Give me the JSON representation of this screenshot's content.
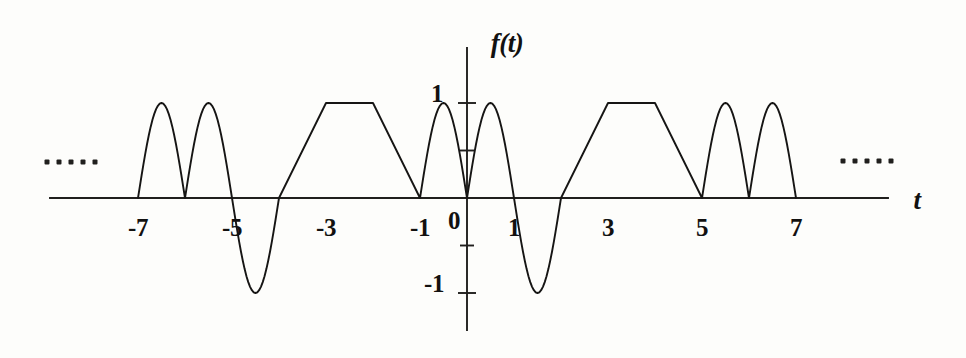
{
  "figure": {
    "background_color": "#fdfdfb",
    "curve_color": "#161514",
    "axis_color": "#201f1d"
  },
  "axes": {
    "y_axis_label": "f(t)",
    "x_axis_label": "t",
    "origin_label": "0",
    "x_tick_labels": [
      "-7",
      "-5",
      "-3",
      "-1",
      "1",
      "3",
      "5",
      "7"
    ],
    "x_tick_values": [
      -7,
      -5,
      -3,
      -1,
      1,
      3,
      5,
      7
    ],
    "y_tick_labels": [
      "1",
      "-1"
    ],
    "y_tick_values": [
      1,
      -1
    ],
    "y_minor_tick_values": [
      0.5,
      -0.5
    ],
    "left_continuation": "…",
    "right_continuation": "…"
  },
  "chart_data": {
    "type": "line",
    "title": "",
    "xlabel": "t",
    "ylabel": "f(t)",
    "xlim": [
      -8.85,
      8.95
    ],
    "ylim": [
      -1.35,
      1.45
    ],
    "grid": false,
    "legend": null,
    "periodic": true,
    "period": 8,
    "segments": [
      {
        "kind": "half-sine-positive",
        "t_start": -7,
        "t_end": -6,
        "amplitude": 1
      },
      {
        "kind": "half-sine-positive",
        "t_start": -6,
        "t_end": -5,
        "amplitude": 1
      },
      {
        "kind": "half-sine-negative",
        "t_start": -5,
        "t_end": -4,
        "amplitude": -1
      },
      {
        "kind": "zero",
        "t_start": -4,
        "t_end": -4,
        "amplitude": 0
      },
      {
        "kind": "ramp-up",
        "t_start": -4,
        "t_end": -3,
        "amplitude": 1
      },
      {
        "kind": "flat-top",
        "t_start": -3,
        "t_end": -2,
        "amplitude": 1
      },
      {
        "kind": "ramp-down",
        "t_start": -2,
        "t_end": -1,
        "amplitude": 0
      },
      {
        "kind": "half-sine-positive",
        "t_start": -1,
        "t_end": 0,
        "amplitude": 1
      },
      {
        "kind": "half-sine-positive",
        "t_start": 0,
        "t_end": 1,
        "amplitude": 1
      },
      {
        "kind": "half-sine-negative",
        "t_start": 1,
        "t_end": 2,
        "amplitude": -1
      },
      {
        "kind": "ramp-up",
        "t_start": 2,
        "t_end": 3,
        "amplitude": 1
      },
      {
        "kind": "flat-top",
        "t_start": 3,
        "t_end": 4,
        "amplitude": 1
      },
      {
        "kind": "ramp-down",
        "t_start": 4,
        "t_end": 5,
        "amplitude": 0
      },
      {
        "kind": "half-sine-positive",
        "t_start": 5,
        "t_end": 6,
        "amplitude": 1
      },
      {
        "kind": "half-sine-positive",
        "t_start": 6,
        "t_end": 7,
        "amplitude": 1
      }
    ],
    "x": [
      -7.0,
      -6.9,
      -6.8,
      -6.7,
      -6.6,
      -6.5,
      -6.4,
      -6.3,
      -6.2,
      -6.1,
      -6.0,
      -5.9,
      -5.8,
      -5.7,
      -5.6,
      -5.5,
      -5.4,
      -5.3,
      -5.2,
      -5.1,
      -5.0,
      -4.9,
      -4.8,
      -4.7,
      -4.6,
      -4.5,
      -4.4,
      -4.3,
      -4.2,
      -4.1,
      -4.0,
      -3.0,
      -2.0,
      -1.0,
      -0.9,
      -0.8,
      -0.7,
      -0.6,
      -0.5,
      -0.4,
      -0.3,
      -0.2,
      -0.1,
      0.0,
      0.1,
      0.2,
      0.3,
      0.4,
      0.5,
      0.6,
      0.7,
      0.8,
      0.9,
      1.0,
      1.1,
      1.2,
      1.3,
      1.4,
      1.5,
      1.6,
      1.7,
      1.8,
      1.9,
      2.0,
      3.0,
      4.0,
      5.0,
      5.1,
      5.2,
      5.3,
      5.4,
      5.5,
      5.6,
      5.7,
      5.8,
      5.9,
      6.0,
      6.1,
      6.2,
      6.3,
      6.4,
      6.5,
      6.6,
      6.7,
      6.8,
      6.9,
      7.0
    ],
    "y": [
      0.0,
      0.309,
      0.588,
      0.809,
      0.951,
      1.0,
      0.951,
      0.809,
      0.588,
      0.309,
      0.0,
      0.309,
      0.588,
      0.809,
      0.951,
      1.0,
      0.951,
      0.809,
      0.588,
      0.309,
      0.0,
      -0.309,
      -0.588,
      -0.809,
      -0.951,
      -1.0,
      -0.951,
      -0.809,
      -0.588,
      -0.309,
      0.0,
      1.0,
      1.0,
      0.0,
      0.309,
      0.588,
      0.809,
      0.951,
      1.0,
      0.951,
      0.809,
      0.588,
      0.309,
      0.0,
      0.309,
      0.588,
      0.809,
      0.951,
      1.0,
      0.951,
      0.809,
      0.588,
      0.309,
      0.0,
      -0.309,
      -0.588,
      -0.809,
      -0.951,
      -1.0,
      -0.951,
      -0.809,
      -0.588,
      -0.309,
      0.0,
      1.0,
      1.0,
      0.0,
      0.309,
      0.588,
      0.809,
      0.951,
      1.0,
      0.951,
      0.809,
      0.588,
      0.309,
      0.0,
      0.309,
      0.588,
      0.809,
      0.951,
      1.0,
      0.951,
      0.809,
      0.588,
      0.309,
      0.0
    ]
  }
}
